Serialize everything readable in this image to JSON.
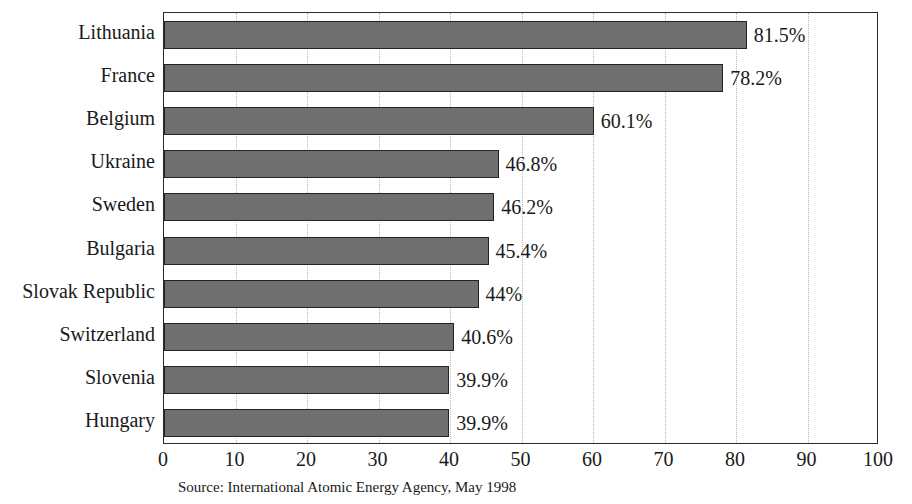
{
  "chart_data": {
    "type": "bar",
    "orientation": "horizontal",
    "title": "",
    "xlabel": "",
    "ylabel": "",
    "xlim": [
      0,
      100
    ],
    "xticks": [
      0,
      10,
      20,
      30,
      40,
      50,
      60,
      70,
      80,
      90,
      100
    ],
    "xtick_labels": [
      "0",
      "10",
      "20",
      "30",
      "40",
      "50",
      "60",
      "70",
      "80",
      "90",
      "100"
    ],
    "grid": true,
    "grid_axis": "x",
    "grid_style": "dotted",
    "legend": false,
    "categories": [
      "Lithuania",
      "France",
      "Belgium",
      "Ukraine",
      "Sweden",
      "Bulgaria",
      "Slovak Republic",
      "Switzerland",
      "Slovenia",
      "Hungary"
    ],
    "values": [
      81.5,
      78.2,
      60.1,
      46.8,
      46.2,
      45.4,
      44,
      40.6,
      39.9,
      39.9
    ],
    "data_labels": [
      "81.5%",
      "78.2%",
      "60.1%",
      "46.8%",
      "46.2%",
      "45.4%",
      "44%",
      "40.6%",
      "39.9%",
      "39.9%"
    ],
    "bar_color": "#6f6f6f",
    "bar_edge_color": "#242424",
    "source": "Source: International Atomic Energy Agency, May 1998"
  },
  "figure": {
    "source_note": "Source: International Atomic Energy Agency, May 1998",
    "title_clipped": ""
  }
}
